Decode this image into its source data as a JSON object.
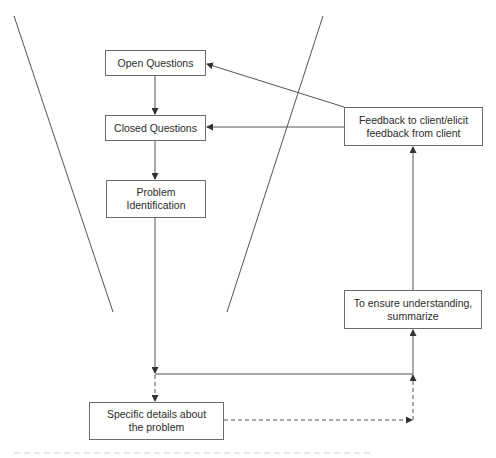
{
  "diagram": {
    "type": "flowchart",
    "colors": {
      "line": "#555555",
      "box_border": "#6b6b6b",
      "text": "#2b2b2b",
      "background": "#ffffff"
    },
    "funnel": {
      "left_line": {
        "x1": 14,
        "y1": 16,
        "x2": 113,
        "y2": 312
      },
      "right_line": {
        "x1": 323,
        "y1": 16,
        "x2": 227,
        "y2": 312
      }
    },
    "nodes": [
      {
        "id": "open_questions",
        "label": "Open Questions",
        "x": 105,
        "y": 50,
        "w": 101,
        "h": 26
      },
      {
        "id": "closed_questions",
        "label": "Closed Questions",
        "x": 105,
        "y": 115,
        "w": 101,
        "h": 26
      },
      {
        "id": "problem_identification",
        "label": "Problem\nIdentification",
        "x": 106,
        "y": 180,
        "w": 100,
        "h": 38
      },
      {
        "id": "specific_details",
        "label": "Specific details about\nthe problem",
        "x": 89,
        "y": 402,
        "w": 135,
        "h": 38
      },
      {
        "id": "summarize",
        "label": "To ensure understanding,\nsummarize",
        "x": 344,
        "y": 290,
        "w": 138,
        "h": 39
      },
      {
        "id": "feedback",
        "label": "Feedback to client/elicit\nfeedback from client",
        "x": 344,
        "y": 107,
        "w": 139,
        "h": 39
      }
    ],
    "edges": [
      {
        "from": "open_questions",
        "to": "closed_questions",
        "style": "solid"
      },
      {
        "from": "closed_questions",
        "to": "problem_identification",
        "style": "solid"
      },
      {
        "from": "problem_identification",
        "to": "junction_line",
        "style": "solid"
      },
      {
        "from": "junction_line",
        "to": "specific_details",
        "style": "dashed"
      },
      {
        "from": "specific_details",
        "to": "right_vertical",
        "style": "dashed"
      },
      {
        "from": "right_vertical",
        "to": "junction_line",
        "style": "dashed"
      },
      {
        "from": "junction_line",
        "to": "summarize",
        "style": "solid"
      },
      {
        "from": "summarize",
        "to": "feedback",
        "style": "solid"
      },
      {
        "from": "feedback",
        "to": "closed_questions",
        "style": "solid"
      },
      {
        "from": "feedback",
        "to": "open_questions",
        "style": "solid"
      }
    ]
  }
}
